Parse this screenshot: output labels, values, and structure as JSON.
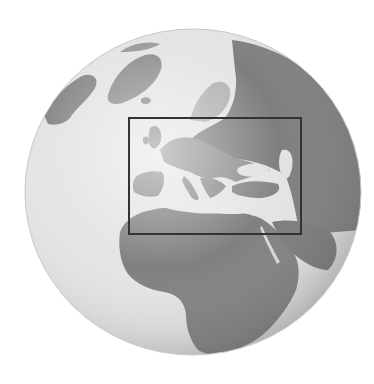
{
  "figure": {
    "type": "globe-locator-map",
    "rendering": "grayscale",
    "alt_description": "Grayscale relief globe centered on Europe and Africa with a rectangle highlighting Europe and the Mediterranean region"
  },
  "globe": {
    "center_x": 193,
    "center_y": 192,
    "radius_x": 168,
    "radius_y": 163,
    "ocean_color": "#e6e6e6",
    "land_color": "#8a8a8a",
    "dark_land_color": "#6e6e6e",
    "limb_shade_color": "#bdbdbd"
  },
  "highlight_box": {
    "label": "Europe and Mediterranean",
    "x": 129,
    "y": 118,
    "width": 172,
    "height": 116,
    "stroke_color": "#333333",
    "stroke_width": 2
  },
  "regions_visible": [
    "Greenland",
    "Iceland",
    "Scandinavia",
    "Europe",
    "Mediterranean Sea",
    "Black Sea",
    "Caspian Sea",
    "North Africa",
    "Africa",
    "Arabian Peninsula",
    "Red Sea",
    "Russia"
  ]
}
